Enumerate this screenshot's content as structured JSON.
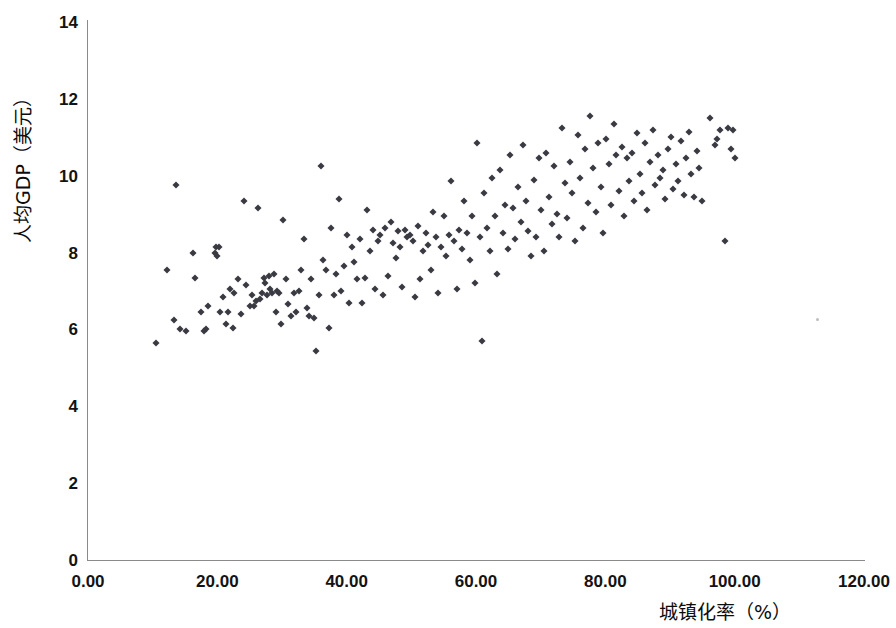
{
  "chart_data": {
    "type": "scatter",
    "title": "",
    "xlabel": "城镇化率（%）",
    "ylabel": "人均GDP（美元）",
    "xlim": [
      0,
      120
    ],
    "ylim": [
      0,
      14
    ],
    "xticks": [
      "0.00",
      "20.00",
      "40.00",
      "60.00",
      "80.00",
      "100.00",
      "120.00"
    ],
    "xtick_values": [
      0,
      20,
      40,
      60,
      80,
      100,
      120
    ],
    "yticks": [
      "0",
      "2",
      "4",
      "6",
      "8",
      "10",
      "12",
      "14"
    ],
    "ytick_values": [
      0,
      2,
      4,
      6,
      8,
      10,
      12,
      14
    ],
    "grid": false,
    "legend": false,
    "marker": "diamond",
    "marker_color": "#3a3a42",
    "axis_color": "#8a8a8a",
    "series": [
      {
        "name": "国家样本",
        "points": [
          [
            10.5,
            5.65
          ],
          [
            12.2,
            7.55
          ],
          [
            13.3,
            6.25
          ],
          [
            13.6,
            9.75
          ],
          [
            14.3,
            6.0
          ],
          [
            15.1,
            5.95
          ],
          [
            16.3,
            8.0
          ],
          [
            16.6,
            7.35
          ],
          [
            17.5,
            6.45
          ],
          [
            17.9,
            5.95
          ],
          [
            18.3,
            6.0
          ],
          [
            18.5,
            6.6
          ],
          [
            19.6,
            8.0
          ],
          [
            19.8,
            8.15
          ],
          [
            20.0,
            7.9
          ],
          [
            20.2,
            8.15
          ],
          [
            20.4,
            6.45
          ],
          [
            20.9,
            6.85
          ],
          [
            21.3,
            6.15
          ],
          [
            21.6,
            6.45
          ],
          [
            22.0,
            7.05
          ],
          [
            22.4,
            6.05
          ],
          [
            22.6,
            6.95
          ],
          [
            23.2,
            7.3
          ],
          [
            23.6,
            6.4
          ],
          [
            24.1,
            9.35
          ],
          [
            24.4,
            7.15
          ],
          [
            25.0,
            6.6
          ],
          [
            25.3,
            6.9
          ],
          [
            25.6,
            6.6
          ],
          [
            26.0,
            6.75
          ],
          [
            26.3,
            9.15
          ],
          [
            26.6,
            6.8
          ],
          [
            26.9,
            6.95
          ],
          [
            27.2,
            7.35
          ],
          [
            27.4,
            7.2
          ],
          [
            27.7,
            6.9
          ],
          [
            28.0,
            7.4
          ],
          [
            28.2,
            7.05
          ],
          [
            28.4,
            6.95
          ],
          [
            28.7,
            7.45
          ],
          [
            29.0,
            6.45
          ],
          [
            29.3,
            7.0
          ],
          [
            29.6,
            6.95
          ],
          [
            29.9,
            6.15
          ],
          [
            30.2,
            8.85
          ],
          [
            30.6,
            7.3
          ],
          [
            31.0,
            6.65
          ],
          [
            31.4,
            6.35
          ],
          [
            31.8,
            6.95
          ],
          [
            32.2,
            6.45
          ],
          [
            32.6,
            7.0
          ],
          [
            33.0,
            7.55
          ],
          [
            33.4,
            8.35
          ],
          [
            33.8,
            6.55
          ],
          [
            34.2,
            6.35
          ],
          [
            34.5,
            7.3
          ],
          [
            34.9,
            6.3
          ],
          [
            35.3,
            5.45
          ],
          [
            35.7,
            6.9
          ],
          [
            36.1,
            10.25
          ],
          [
            36.4,
            7.8
          ],
          [
            36.8,
            7.55
          ],
          [
            37.2,
            6.05
          ],
          [
            37.6,
            8.65
          ],
          [
            38.0,
            6.9
          ],
          [
            38.4,
            7.45
          ],
          [
            38.8,
            9.4
          ],
          [
            39.2,
            7.0
          ],
          [
            39.6,
            7.65
          ],
          [
            40.0,
            8.45
          ],
          [
            40.4,
            6.7
          ],
          [
            40.8,
            8.15
          ],
          [
            41.2,
            7.75
          ],
          [
            41.6,
            7.3
          ],
          [
            42.0,
            8.35
          ],
          [
            42.4,
            6.7
          ],
          [
            42.8,
            7.35
          ],
          [
            43.2,
            9.1
          ],
          [
            43.6,
            8.05
          ],
          [
            44.0,
            8.6
          ],
          [
            44.4,
            7.05
          ],
          [
            44.8,
            8.3
          ],
          [
            45.2,
            8.45
          ],
          [
            45.6,
            6.9
          ],
          [
            46.0,
            8.65
          ],
          [
            46.4,
            7.4
          ],
          [
            46.8,
            8.8
          ],
          [
            47.2,
            8.25
          ],
          [
            47.6,
            7.85
          ],
          [
            48.0,
            8.55
          ],
          [
            48.3,
            8.15
          ],
          [
            48.6,
            7.1
          ],
          [
            49.0,
            8.6
          ],
          [
            49.4,
            8.4
          ],
          [
            49.8,
            8.45
          ],
          [
            50.2,
            8.3
          ],
          [
            50.6,
            6.85
          ],
          [
            51.0,
            8.7
          ],
          [
            51.4,
            7.3
          ],
          [
            51.8,
            8.05
          ],
          [
            52.2,
            8.5
          ],
          [
            52.6,
            8.2
          ],
          [
            53.0,
            7.55
          ],
          [
            53.4,
            9.05
          ],
          [
            53.8,
            8.4
          ],
          [
            54.2,
            6.95
          ],
          [
            54.6,
            8.15
          ],
          [
            55.0,
            8.95
          ],
          [
            55.4,
            7.9
          ],
          [
            55.8,
            8.45
          ],
          [
            56.2,
            9.85
          ],
          [
            56.6,
            8.3
          ],
          [
            57.0,
            7.05
          ],
          [
            57.4,
            8.6
          ],
          [
            57.8,
            8.1
          ],
          [
            58.2,
            9.35
          ],
          [
            58.6,
            8.5
          ],
          [
            59.0,
            7.8
          ],
          [
            59.4,
            8.95
          ],
          [
            59.8,
            7.2
          ],
          [
            60.2,
            10.85
          ],
          [
            60.6,
            8.4
          ],
          [
            61.0,
            5.7
          ],
          [
            61.3,
            9.55
          ],
          [
            61.7,
            8.65
          ],
          [
            62.1,
            8.05
          ],
          [
            62.5,
            9.95
          ],
          [
            62.9,
            8.95
          ],
          [
            63.3,
            7.45
          ],
          [
            63.7,
            10.15
          ],
          [
            64.1,
            8.5
          ],
          [
            64.5,
            9.25
          ],
          [
            64.9,
            8.1
          ],
          [
            65.3,
            10.55
          ],
          [
            65.7,
            9.15
          ],
          [
            66.1,
            8.35
          ],
          [
            66.5,
            9.7
          ],
          [
            66.9,
            8.8
          ],
          [
            67.3,
            10.8
          ],
          [
            67.7,
            9.35
          ],
          [
            68.1,
            8.55
          ],
          [
            68.5,
            7.9
          ],
          [
            68.9,
            9.9
          ],
          [
            69.3,
            8.4
          ],
          [
            69.7,
            10.45
          ],
          [
            70.1,
            9.1
          ],
          [
            70.5,
            8.05
          ],
          [
            70.9,
            10.6
          ],
          [
            71.3,
            9.45
          ],
          [
            71.7,
            8.75
          ],
          [
            72.1,
            10.25
          ],
          [
            72.5,
            9.0
          ],
          [
            72.9,
            8.4
          ],
          [
            73.3,
            11.25
          ],
          [
            73.7,
            9.8
          ],
          [
            74.1,
            8.9
          ],
          [
            74.5,
            10.35
          ],
          [
            74.9,
            9.55
          ],
          [
            75.3,
            8.3
          ],
          [
            75.7,
            11.05
          ],
          [
            76.1,
            9.95
          ],
          [
            76.5,
            8.65
          ],
          [
            76.9,
            10.7
          ],
          [
            77.3,
            9.3
          ],
          [
            77.7,
            11.55
          ],
          [
            78.1,
            10.2
          ],
          [
            78.5,
            9.05
          ],
          [
            78.9,
            10.85
          ],
          [
            79.3,
            9.7
          ],
          [
            79.7,
            8.5
          ],
          [
            80.1,
            10.95
          ],
          [
            80.5,
            10.3
          ],
          [
            80.9,
            9.25
          ],
          [
            81.3,
            11.35
          ],
          [
            81.7,
            10.55
          ],
          [
            82.1,
            9.6
          ],
          [
            82.5,
            10.75
          ],
          [
            82.9,
            8.95
          ],
          [
            83.3,
            10.45
          ],
          [
            83.7,
            9.85
          ],
          [
            84.1,
            10.6
          ],
          [
            84.5,
            9.35
          ],
          [
            84.9,
            11.1
          ],
          [
            85.3,
            10.05
          ],
          [
            85.7,
            9.55
          ],
          [
            86.1,
            10.85
          ],
          [
            86.5,
            9.1
          ],
          [
            86.9,
            10.35
          ],
          [
            87.3,
            11.2
          ],
          [
            87.7,
            9.75
          ],
          [
            88.1,
            10.55
          ],
          [
            88.5,
            9.95
          ],
          [
            88.9,
            10.15
          ],
          [
            89.3,
            9.4
          ],
          [
            89.7,
            10.7
          ],
          [
            90.1,
            11.0
          ],
          [
            90.5,
            9.65
          ],
          [
            90.9,
            10.3
          ],
          [
            91.3,
            9.85
          ],
          [
            91.7,
            10.9
          ],
          [
            92.1,
            9.5
          ],
          [
            92.5,
            10.45
          ],
          [
            92.9,
            11.15
          ],
          [
            93.3,
            10.05
          ],
          [
            93.7,
            9.45
          ],
          [
            94.1,
            10.65
          ],
          [
            94.5,
            10.2
          ],
          [
            95.0,
            9.35
          ],
          [
            96.2,
            11.5
          ],
          [
            97.0,
            10.8
          ],
          [
            97.3,
            10.95
          ],
          [
            97.8,
            11.2
          ],
          [
            98.5,
            8.3
          ],
          [
            99.0,
            11.25
          ],
          [
            99.5,
            10.7
          ],
          [
            99.8,
            11.2
          ],
          [
            100.0,
            10.45
          ]
        ]
      }
    ]
  },
  "axes": {
    "y_title": "人均GDP（美元）",
    "x_title": "城镇化率（%）"
  }
}
